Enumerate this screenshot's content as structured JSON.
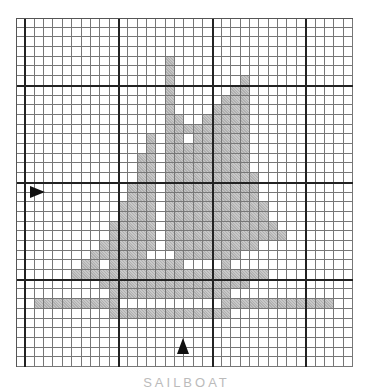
{
  "figure": {
    "type": "cross-stitch grid pattern",
    "subject": "sailboat",
    "grid": {
      "columns": 36,
      "rows": 36,
      "major_every": 10,
      "major_col_offset": 1,
      "major_row_offset": 7
    },
    "colors": {
      "filled": "#c8c8c8",
      "line_minor": "#777777",
      "line_major": "#222222",
      "background": "#ffffff"
    },
    "center_markers": [
      {
        "name": "row-center-arrow",
        "direction": "right",
        "row": 17
      },
      {
        "name": "column-center-arrow",
        "direction": "up",
        "column": 17
      }
    ],
    "filled_rows": [
      {
        "row": 4,
        "ranges": [
          [
            16,
            16
          ]
        ]
      },
      {
        "row": 5,
        "ranges": [
          [
            16,
            16
          ]
        ]
      },
      {
        "row": 6,
        "ranges": [
          [
            16,
            16
          ],
          [
            24,
            24
          ]
        ]
      },
      {
        "row": 7,
        "ranges": [
          [
            16,
            16
          ],
          [
            23,
            24
          ]
        ]
      },
      {
        "row": 8,
        "ranges": [
          [
            16,
            16
          ],
          [
            22,
            24
          ]
        ]
      },
      {
        "row": 9,
        "ranges": [
          [
            16,
            16
          ],
          [
            21,
            24
          ]
        ]
      },
      {
        "row": 10,
        "ranges": [
          [
            16,
            17
          ],
          [
            20,
            24
          ]
        ]
      },
      {
        "row": 11,
        "ranges": [
          [
            16,
            18
          ],
          [
            19,
            24
          ]
        ]
      },
      {
        "row": 12,
        "ranges": [
          [
            14,
            14
          ],
          [
            16,
            17
          ],
          [
            19,
            24
          ]
        ]
      },
      {
        "row": 13,
        "ranges": [
          [
            14,
            14
          ],
          [
            16,
            24
          ]
        ]
      },
      {
        "row": 14,
        "ranges": [
          [
            13,
            14
          ],
          [
            16,
            24
          ]
        ]
      },
      {
        "row": 15,
        "ranges": [
          [
            13,
            14
          ],
          [
            16,
            24
          ]
        ]
      },
      {
        "row": 16,
        "ranges": [
          [
            13,
            14
          ],
          [
            16,
            25
          ]
        ]
      },
      {
        "row": 17,
        "ranges": [
          [
            12,
            14
          ],
          [
            16,
            25
          ]
        ]
      },
      {
        "row": 18,
        "ranges": [
          [
            12,
            14
          ],
          [
            16,
            25
          ]
        ]
      },
      {
        "row": 19,
        "ranges": [
          [
            11,
            14
          ],
          [
            16,
            26
          ]
        ]
      },
      {
        "row": 20,
        "ranges": [
          [
            11,
            14
          ],
          [
            16,
            26
          ]
        ]
      },
      {
        "row": 21,
        "ranges": [
          [
            10,
            14
          ],
          [
            16,
            27
          ]
        ]
      },
      {
        "row": 22,
        "ranges": [
          [
            10,
            14
          ],
          [
            16,
            28
          ]
        ]
      },
      {
        "row": 23,
        "ranges": [
          [
            9,
            14
          ],
          [
            16,
            25
          ]
        ]
      },
      {
        "row": 24,
        "ranges": [
          [
            8,
            13
          ],
          [
            17,
            20
          ],
          [
            21,
            23
          ]
        ]
      },
      {
        "row": 25,
        "ranges": [
          [
            7,
            8
          ],
          [
            10,
            14
          ],
          [
            15,
            17
          ],
          [
            22,
            22
          ]
        ]
      },
      {
        "row": 26,
        "ranges": [
          [
            6,
            26
          ]
        ]
      },
      {
        "row": 27,
        "ranges": [
          [
            9,
            24
          ]
        ]
      },
      {
        "row": 28,
        "ranges": [
          [
            10,
            22
          ]
        ]
      },
      {
        "row": 29,
        "ranges": [
          [
            2,
            10
          ],
          [
            22,
            33
          ]
        ]
      },
      {
        "row": 30,
        "ranges": [
          [
            10,
            22
          ]
        ]
      }
    ]
  },
  "caption": "SAILBOAT"
}
